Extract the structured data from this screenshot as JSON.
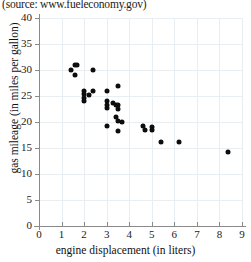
{
  "source_note": "(source: www.fueleconomy.gov)",
  "chart_data": {
    "type": "scatter",
    "title": "",
    "xlabel": "engine displacement (in liters)",
    "ylabel": "gas mileage (in miles per gallon)",
    "xlim": [
      0,
      9
    ],
    "ylim": [
      0,
      40
    ],
    "xticks": [
      0,
      1,
      2,
      3,
      4,
      5,
      6,
      7,
      8,
      9
    ],
    "yticks": [
      0,
      5,
      10,
      15,
      20,
      25,
      30,
      35,
      40
    ],
    "grid": true,
    "legend": "none",
    "marker": "filled-circle",
    "marker_color": "#0d0d0d",
    "points": [
      {
        "x": 1.4,
        "y": 30.0
      },
      {
        "x": 1.6,
        "y": 31.0
      },
      {
        "x": 1.7,
        "y": 31.0
      },
      {
        "x": 1.6,
        "y": 29.0
      },
      {
        "x": 2.4,
        "y": 30.0
      },
      {
        "x": 2.0,
        "y": 26.0
      },
      {
        "x": 2.0,
        "y": 25.3
      },
      {
        "x": 2.0,
        "y": 24.7
      },
      {
        "x": 2.0,
        "y": 24.0
      },
      {
        "x": 2.2,
        "y": 25.2
      },
      {
        "x": 2.4,
        "y": 26.0
      },
      {
        "x": 3.0,
        "y": 26.0
      },
      {
        "x": 3.5,
        "y": 27.0
      },
      {
        "x": 3.0,
        "y": 24.0
      },
      {
        "x": 3.0,
        "y": 23.3
      },
      {
        "x": 3.0,
        "y": 22.7
      },
      {
        "x": 3.3,
        "y": 23.6
      },
      {
        "x": 3.4,
        "y": 23.2
      },
      {
        "x": 3.5,
        "y": 23.2
      },
      {
        "x": 3.5,
        "y": 22.5
      },
      {
        "x": 3.4,
        "y": 21.0
      },
      {
        "x": 3.5,
        "y": 20.1
      },
      {
        "x": 3.7,
        "y": 20.0
      },
      {
        "x": 3.0,
        "y": 19.2
      },
      {
        "x": 3.5,
        "y": 18.2
      },
      {
        "x": 4.6,
        "y": 19.2
      },
      {
        "x": 4.7,
        "y": 18.4
      },
      {
        "x": 5.0,
        "y": 19.0
      },
      {
        "x": 5.0,
        "y": 18.4
      },
      {
        "x": 5.4,
        "y": 16.1
      },
      {
        "x": 6.2,
        "y": 16.1
      },
      {
        "x": 8.4,
        "y": 14.2
      }
    ]
  }
}
